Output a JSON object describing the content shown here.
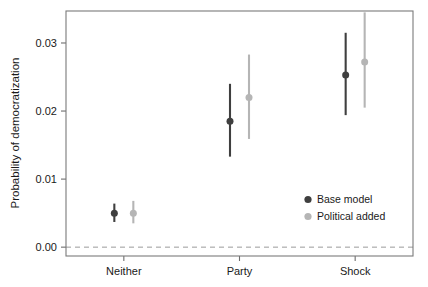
{
  "chart_data": {
    "type": "scatter",
    "title": "",
    "subtitle": "",
    "xlabel": "",
    "ylabel": "Probability of democratization",
    "categories": [
      "Neither",
      "Party",
      "Shock"
    ],
    "ylim": [
      -0.0013,
      0.0347
    ],
    "yticks": [
      0.0,
      0.01,
      0.02,
      0.03
    ],
    "ytick_labels": [
      "0.00",
      "0.01",
      "0.02",
      "0.03"
    ],
    "grid": false,
    "zero_reference_line": 0.0,
    "error_bar_style": "vertical-interval-with-point",
    "legend_position": "inside-bottom-right",
    "series": [
      {
        "name": "Base model",
        "color": "#3f3f3f",
        "values": [
          0.005,
          0.0185,
          0.0253
        ],
        "ci_low": [
          0.0037,
          0.0133,
          0.0194
        ],
        "ci_high": [
          0.0064,
          0.024,
          0.0315
        ]
      },
      {
        "name": "Political added",
        "color": "#b5b5b5",
        "values": [
          0.005,
          0.022,
          0.0272
        ],
        "ci_low": [
          0.0035,
          0.0159,
          0.0205
        ],
        "ci_high": [
          0.0068,
          0.0283,
          0.0345
        ]
      }
    ],
    "legend": [
      {
        "label": "Base model",
        "color": "#3f3f3f",
        "marker": "circle"
      },
      {
        "label": "Political added",
        "color": "#b5b5b5",
        "marker": "circle"
      }
    ]
  },
  "axis": {
    "frame_color": "#7a7a7a",
    "zero_line_color": "#9a9a9a",
    "tick_color": "#6e6e6e"
  }
}
